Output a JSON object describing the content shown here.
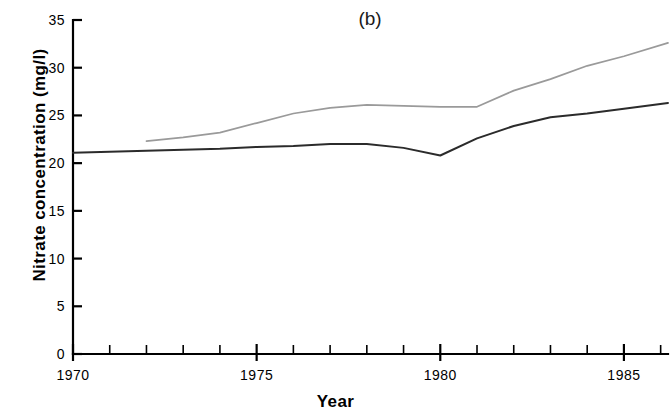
{
  "figure": {
    "panel_label": "(b)",
    "background_color": "#ffffff"
  },
  "chart_data": {
    "type": "line",
    "title": "(b)",
    "xlabel": "Year",
    "ylabel": "Nitrate concentration (mg/l)",
    "xlim": [
      1970,
      1986.2
    ],
    "ylim": [
      0,
      35
    ],
    "grid": false,
    "legend": "none",
    "y_ticks": [
      0,
      5,
      10,
      15,
      20,
      25,
      30,
      35
    ],
    "y_tick_labels": [
      "0",
      "5",
      "10",
      "15",
      "20",
      "25",
      "30",
      "35"
    ],
    "x_ticks": [
      1970,
      1975,
      1980,
      1985
    ],
    "x_tick_labels": [
      "1970",
      "1975",
      "1980",
      "1985"
    ],
    "x_minor_ticks": [
      1971,
      1972,
      1973,
      1974,
      1976,
      1977,
      1978,
      1979,
      1981,
      1982,
      1983,
      1984,
      1986
    ],
    "series": [
      {
        "name": "lower-series",
        "color": "#2b2b2b",
        "width": 2.0,
        "x": [
          1970,
          1971,
          1972,
          1973,
          1974,
          1975,
          1976,
          1977,
          1978,
          1979,
          1980,
          1981,
          1982,
          1983,
          1984,
          1985,
          1986.2
        ],
        "values": [
          21.1,
          21.2,
          21.3,
          21.4,
          21.5,
          21.7,
          21.8,
          22.0,
          22.0,
          21.6,
          20.8,
          22.6,
          23.9,
          24.8,
          25.2,
          25.7,
          26.3
        ]
      },
      {
        "name": "upper-series",
        "color": "#9a9a9a",
        "width": 1.7,
        "x": [
          1972,
          1973,
          1974,
          1975,
          1976,
          1977,
          1978,
          1979,
          1980,
          1981,
          1982,
          1983,
          1984,
          1985,
          1986.2
        ],
        "values": [
          22.3,
          22.7,
          23.2,
          24.2,
          25.2,
          25.8,
          26.1,
          26.0,
          25.9,
          25.9,
          27.6,
          28.8,
          30.2,
          31.2,
          32.6
        ]
      }
    ]
  }
}
